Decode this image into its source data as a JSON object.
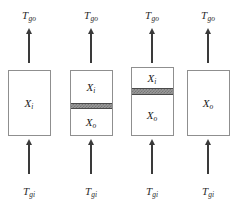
{
  "figure": {
    "type": "schematic-diagram",
    "background_color": "#ffffff",
    "box_border_color": "#8f8f8f",
    "arrow_color": "#3a3a3a",
    "band_color": "#9a9a9a",
    "band_border_color": "#4a4a4a"
  },
  "labels": {
    "gas_outlet": {
      "base": "T",
      "sub": "go"
    },
    "gas_inlet": {
      "base": "T",
      "sub": "gi"
    },
    "phase_inner": {
      "base": "X",
      "sub": "i"
    },
    "phase_outer": {
      "base": "X",
      "sub": "o"
    }
  },
  "columns": [
    {
      "id": "column-1",
      "center_x": 29,
      "top_label": {
        "base": "T",
        "sub": "go"
      },
      "bottom_label": {
        "base": "T",
        "sub": "gi"
      },
      "box": {
        "top": 70,
        "height": 66
      },
      "band": null,
      "segments": [
        {
          "name": "segment-inner",
          "label": {
            "base": "X",
            "sub": "i"
          },
          "top_pct": 0,
          "height_pct": 100
        }
      ]
    },
    {
      "id": "column-2",
      "center_x": 91,
      "top_label": {
        "base": "T",
        "sub": "go"
      },
      "bottom_label": {
        "base": "T",
        "sub": "gi"
      },
      "box": {
        "top": 70,
        "height": 66
      },
      "band": {
        "top_pct": 50,
        "height_pct": 10
      },
      "segments": [
        {
          "name": "segment-inner",
          "label": {
            "base": "X",
            "sub": "i"
          },
          "top_pct": 0,
          "height_pct": 50
        },
        {
          "name": "segment-outer",
          "label": {
            "base": "X",
            "sub": "o"
          },
          "top_pct": 60,
          "height_pct": 40
        }
      ]
    },
    {
      "id": "column-3",
      "center_x": 152,
      "top_label": {
        "base": "T",
        "sub": "go"
      },
      "bottom_label": {
        "base": "T",
        "sub": "gi"
      },
      "box": {
        "top": 67,
        "height": 69
      },
      "band": {
        "top_pct": 30,
        "height_pct": 11
      },
      "segments": [
        {
          "name": "segment-inner",
          "label": {
            "base": "X",
            "sub": "i"
          },
          "top_pct": 0,
          "height_pct": 30
        },
        {
          "name": "segment-outer",
          "label": {
            "base": "X",
            "sub": "o"
          },
          "top_pct": 41,
          "height_pct": 59
        }
      ]
    },
    {
      "id": "column-4",
      "center_x": 208,
      "top_label": {
        "base": "T",
        "sub": "go"
      },
      "bottom_label": {
        "base": "T",
        "sub": "gi"
      },
      "box": {
        "top": 70,
        "height": 66
      },
      "band": null,
      "segments": [
        {
          "name": "segment-outer",
          "label": {
            "base": "X",
            "sub": "o"
          },
          "top_pct": 0,
          "height_pct": 100
        }
      ]
    }
  ]
}
